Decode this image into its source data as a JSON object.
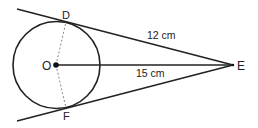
{
  "diagram": {
    "points": {
      "O": {
        "label": "O",
        "x": 56,
        "y": 65
      },
      "D": {
        "label": "D",
        "x": 64,
        "y": 22
      },
      "F": {
        "label": "F",
        "x": 64,
        "y": 108
      },
      "E": {
        "label": "E",
        "x": 233,
        "y": 65
      }
    },
    "circle": {
      "cx": 56.5,
      "cy": 65,
      "r": 43.5
    },
    "measurements": {
      "DE": "12 cm",
      "OE": "15 cm"
    },
    "colors": {
      "stroke": "#222222",
      "dashed": "#888888",
      "background": "#ffffff"
    }
  }
}
